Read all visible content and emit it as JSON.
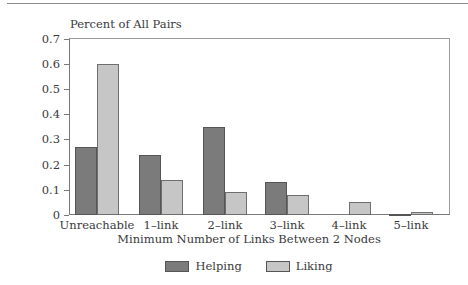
{
  "chart_data": {
    "type": "bar",
    "title": "",
    "ylabel": "Percent of All Pairs",
    "xlabel": "Minimum Number of Links Between 2 Nodes",
    "categories": [
      "Unreachable",
      "1–link",
      "2–link",
      "3–link",
      "4–link",
      "5–link"
    ],
    "series": [
      {
        "name": "Helping",
        "color": "#7b7b7b",
        "values": [
          0.27,
          0.24,
          0.35,
          0.13,
          0.0,
          0.002
        ]
      },
      {
        "name": "Liking",
        "color": "#c6c6c6",
        "values": [
          0.6,
          0.14,
          0.09,
          0.08,
          0.05,
          0.01
        ]
      }
    ],
    "ylim": [
      0,
      0.7
    ],
    "yticks": [
      "0",
      "0.1",
      "0.2",
      "0.3",
      "0.4",
      "0.5",
      "0.6",
      "0.7"
    ],
    "grid": false,
    "legend_position": "bottom"
  }
}
